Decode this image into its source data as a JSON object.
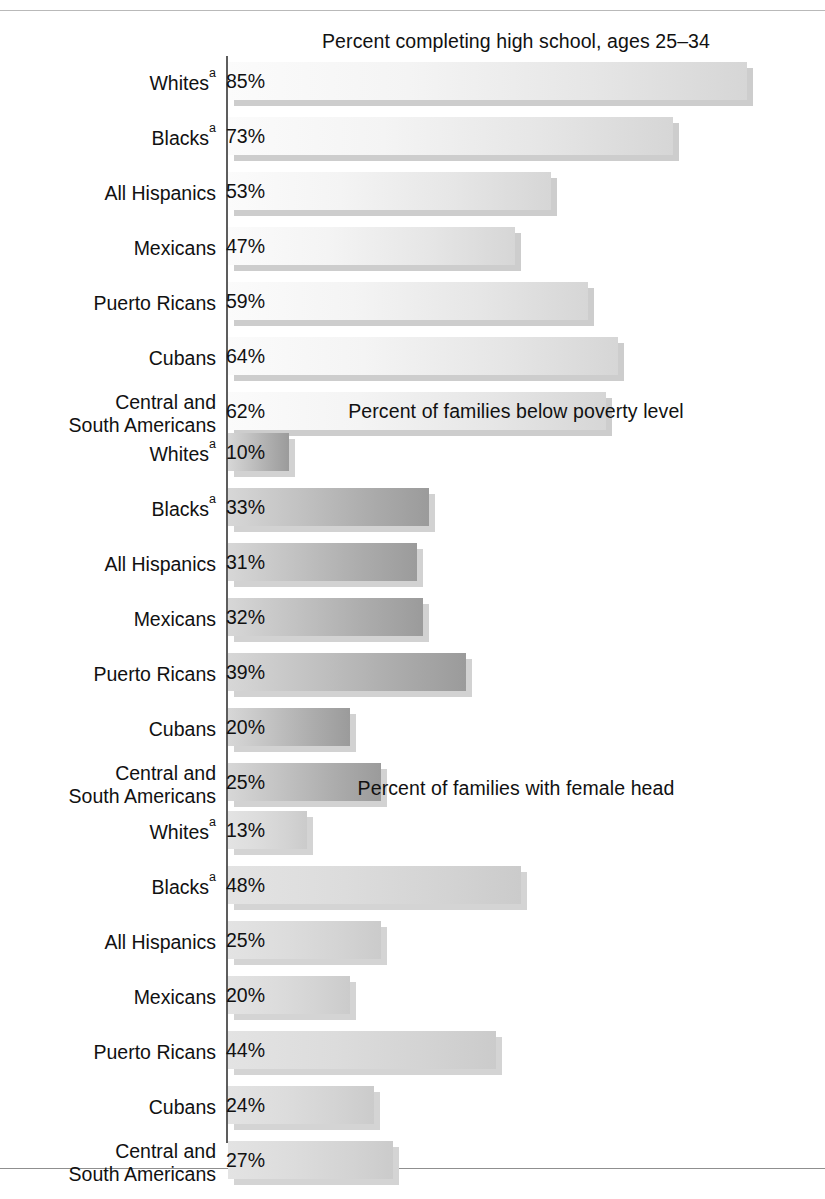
{
  "figure": {
    "axis_label_note": "a",
    "value_suffix": "%"
  },
  "chart_data": {
    "type": "bar",
    "orientation": "horizontal",
    "title": "",
    "xlabel": "",
    "ylabel": "",
    "grid": false,
    "legend": "none",
    "xlim": [
      0,
      90
    ],
    "axis_scale_px_per_percent": 6.1,
    "categories": [
      "Whites",
      "Blacks",
      "All Hispanics",
      "Mexicans",
      "Puerto Ricans",
      "Cubans",
      "Central and South Americans"
    ],
    "panels": [
      {
        "id": "panel-high-school",
        "title": "Percent completing high school, ages 25–34",
        "categories": [
          "Whites",
          "Blacks",
          "All Hispanics",
          "Mexicans",
          "Puerto Ricans",
          "Cubans",
          "Central and South Americans"
        ],
        "values": [
          85,
          73,
          53,
          47,
          59,
          64,
          62
        ],
        "labels": [
          "85%",
          "73%",
          "53%",
          "47%",
          "59%",
          "64%",
          "62%"
        ]
      },
      {
        "id": "panel-poverty",
        "title": "Percent of families below poverty level",
        "categories": [
          "Whites",
          "Blacks",
          "All Hispanics",
          "Mexicans",
          "Puerto Ricans",
          "Cubans",
          "Central and South Americans"
        ],
        "values": [
          10,
          33,
          31,
          32,
          39,
          20,
          25
        ],
        "labels": [
          "10%",
          "33%",
          "31%",
          "32%",
          "39%",
          "20%",
          "25%"
        ]
      },
      {
        "id": "panel-female-head",
        "title": "Percent of families with female head",
        "categories": [
          "Whites",
          "Blacks",
          "All Hispanics",
          "Mexicans",
          "Puerto Ricans",
          "Cubans",
          "Central and South Americans"
        ],
        "values": [
          13,
          48,
          25,
          20,
          44,
          24,
          27
        ],
        "labels": [
          "13%",
          "48%",
          "25%",
          "20%",
          "44%",
          "24%",
          "27%"
        ]
      }
    ]
  },
  "panels": [
    {
      "title": "Percent completing high school, ages 25–34",
      "rows": [
        {
          "label_line1": "Whites",
          "sup": "a",
          "label_line2": "",
          "value": "85%"
        },
        {
          "label_line1": "Blacks",
          "sup": "a",
          "label_line2": "",
          "value": "73%"
        },
        {
          "label_line1": "All Hispanics",
          "sup": "",
          "label_line2": "",
          "value": "53%"
        },
        {
          "label_line1": "Mexicans",
          "sup": "",
          "label_line2": "",
          "value": "47%"
        },
        {
          "label_line1": "Puerto Ricans",
          "sup": "",
          "label_line2": "",
          "value": "59%"
        },
        {
          "label_line1": "Cubans",
          "sup": "",
          "label_line2": "",
          "value": "64%"
        },
        {
          "label_line1": "Central and",
          "sup": "",
          "label_line2": "South Americans",
          "value": "62%"
        }
      ]
    },
    {
      "title": "Percent of families below poverty level",
      "rows": [
        {
          "label_line1": "Whites",
          "sup": "a",
          "label_line2": "",
          "value": "10%"
        },
        {
          "label_line1": "Blacks",
          "sup": "a",
          "label_line2": "",
          "value": "33%"
        },
        {
          "label_line1": "All Hispanics",
          "sup": "",
          "label_line2": "",
          "value": "31%"
        },
        {
          "label_line1": "Mexicans",
          "sup": "",
          "label_line2": "",
          "value": "32%"
        },
        {
          "label_line1": "Puerto Ricans",
          "sup": "",
          "label_line2": "",
          "value": "39%"
        },
        {
          "label_line1": "Cubans",
          "sup": "",
          "label_line2": "",
          "value": "20%"
        },
        {
          "label_line1": "Central and",
          "sup": "",
          "label_line2": "South Americans",
          "value": "25%"
        }
      ]
    },
    {
      "title": "Percent of families with female head",
      "rows": [
        {
          "label_line1": "Whites",
          "sup": "a",
          "label_line2": "",
          "value": "13%"
        },
        {
          "label_line1": "Blacks",
          "sup": "a",
          "label_line2": "",
          "value": "48%"
        },
        {
          "label_line1": "All Hispanics",
          "sup": "",
          "label_line2": "",
          "value": "25%"
        },
        {
          "label_line1": "Mexicans",
          "sup": "",
          "label_line2": "",
          "value": "20%"
        },
        {
          "label_line1": "Puerto Ricans",
          "sup": "",
          "label_line2": "",
          "value": "44%"
        },
        {
          "label_line1": "Cubans",
          "sup": "",
          "label_line2": "",
          "value": "24%"
        },
        {
          "label_line1": "Central and",
          "sup": "",
          "label_line2": "South Americans",
          "value": "27%"
        }
      ]
    }
  ]
}
